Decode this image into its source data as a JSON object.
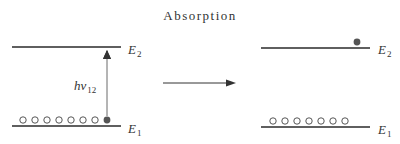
{
  "title": "Absorption",
  "left": {
    "upper_level": {
      "symbol": "E",
      "subscript": "2"
    },
    "lower_level": {
      "symbol": "E",
      "subscript": "1"
    },
    "photon_label": {
      "symbol": "hν",
      "subscript": "12"
    },
    "open_circles": 7,
    "filled_circles": 1
  },
  "right": {
    "upper_level": {
      "symbol": "E",
      "subscript": "2"
    },
    "lower_level": {
      "symbol": "E",
      "subscript": "1"
    },
    "open_circles": 7,
    "filled_circles": 1
  },
  "colors": {
    "line": "#2a2a2a",
    "filled_dot": "#555555",
    "arrow": "#444444"
  }
}
